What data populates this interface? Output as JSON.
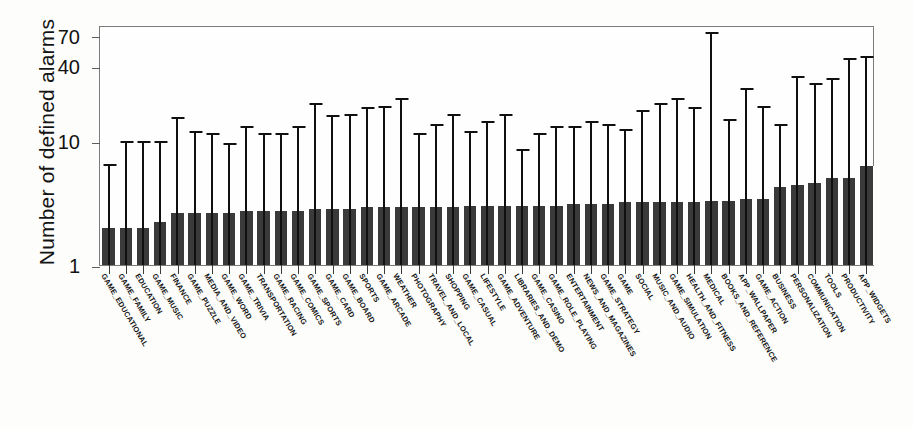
{
  "chart_data": {
    "type": "bar",
    "title": "",
    "xlabel": "",
    "ylabel": "Number of defined alarms",
    "yscale": "log",
    "ylim": [
      1,
      85
    ],
    "yticks": [
      1,
      10,
      40,
      70
    ],
    "ytick_labels": [
      "1",
      "10",
      "40",
      "70"
    ],
    "grid": false,
    "legend": null,
    "error_bar_style": "upper-whisker-with-cap",
    "categories": [
      "GAME_EDUCATIONAL",
      "GAME_FAMILY",
      "EDUCATION",
      "GAME_MUSIC",
      "FINANCE",
      "GAME_PUZZLE",
      "MEDIA_AND_VIDEO",
      "GAME_WORD",
      "GAME_TRIVIA",
      "TRANSPORTATION",
      "GAME_RACING",
      "GAME_COMICS",
      "GAME_SPORTS",
      "GAME_CARD",
      "GAME_BOARD",
      "SPORTS",
      "GAME_ARCADE",
      "WEATHER",
      "PHOTOGRAPHY",
      "TRAVEL_AND_LOCAL",
      "SHOPPING",
      "GAME_CASUAL",
      "LIFESTYLE",
      "GAME_ADVENTURE",
      "LIBRARIES_AND_DEMO",
      "GAME_CASINO",
      "GAME_ROLE_PLAYING",
      "ENTERTAINMENT",
      "NEWS_AND_MAGAZINES",
      "GAME_STRATEGY",
      "GAME",
      "SOCIAL",
      "MUSIC_AND_AUDIO",
      "GAME_SIMULATION",
      "HEALTH_AND_FITNESS",
      "MEDICAL",
      "BOOKS_AND_REFERENCE",
      "APP_WALLPAPER",
      "GAME_ACTION",
      "BUSINESS",
      "PERSONALIZATION",
      "COMMUNICATION",
      "TOOLS",
      "PRODUCTIVITY",
      "APP_WIDGETS"
    ],
    "values": [
      2.0,
      2.0,
      2.0,
      2.2,
      2.6,
      2.6,
      2.6,
      2.6,
      2.7,
      2.7,
      2.7,
      2.7,
      2.8,
      2.8,
      2.8,
      2.9,
      2.9,
      2.9,
      2.9,
      2.9,
      2.9,
      3.0,
      3.0,
      3.0,
      3.0,
      3.0,
      3.0,
      3.1,
      3.1,
      3.1,
      3.2,
      3.2,
      3.2,
      3.2,
      3.2,
      3.3,
      3.3,
      3.4,
      3.4,
      4.2,
      4.4,
      4.6,
      5.0,
      5.0,
      6.2
    ],
    "upper_errors": [
      6.5,
      10.0,
      10.0,
      10.0,
      15.5,
      12.0,
      11.5,
      9.5,
      13.0,
      11.5,
      11.5,
      13.0,
      20.0,
      16.0,
      16.5,
      18.5,
      19.0,
      22.0,
      11.5,
      13.5,
      16.5,
      12.0,
      14.5,
      16.5,
      8.5,
      11.5,
      13.0,
      13.0,
      14.5,
      13.5,
      12.5,
      17.5,
      20.0,
      22.0,
      18.5,
      75.0,
      15.0,
      26.5,
      19.0,
      13.5,
      33.0,
      29.0,
      32.0,
      46.0,
      48.0
    ]
  },
  "axis": {
    "y_title": "Number of defined alarms"
  }
}
